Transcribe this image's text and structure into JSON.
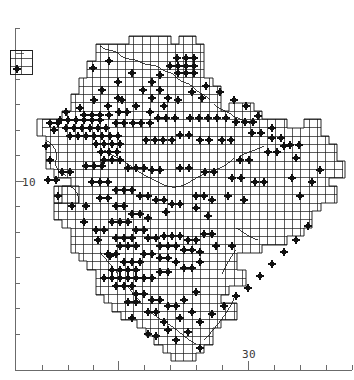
{
  "figure": {
    "kind": "distribution-dot-map",
    "background_color": "#ffffff",
    "line_color": "#111111",
    "dot_color": "#111111",
    "axis_color": "#6b6b6b"
  },
  "axes": {
    "x_axis": {
      "label_text": "30",
      "label_x": 249,
      "label_y": 358,
      "baseline_y": 370,
      "start_x": 15,
      "end_x": 352,
      "ticks": [
        15,
        42,
        68,
        93,
        118,
        144,
        170,
        196,
        222,
        248,
        274,
        300,
        326,
        352
      ],
      "major_ticks": [
        118,
        248
      ],
      "tick_len_minor": 5,
      "tick_len_major": 9
    },
    "y_axis": {
      "label_text": "10",
      "label_x": 22,
      "label_y": 186,
      "baseline_x": 15,
      "start_y": 28,
      "end_y": 370,
      "ticks": [
        28,
        53,
        79,
        104,
        130,
        155,
        181,
        206,
        232,
        257,
        283,
        308,
        334
      ],
      "major_ticks": [
        53,
        181
      ],
      "tick_len_minor": 5,
      "tick_len_major": 9
    }
  },
  "inset": {
    "name": "outlier-inset-box",
    "x": 10,
    "y": 50,
    "width": 22,
    "height": 24,
    "cols": 2,
    "rows": 3,
    "dots": [
      {
        "x": 17,
        "y": 69
      }
    ]
  },
  "grid": {
    "cell_size": 8.35,
    "origin_x": 42.0,
    "origin_y": 36.0,
    "cols": 36,
    "rows": 39,
    "note": "grid overlay clipped to region outline"
  },
  "chart_data": {
    "type": "scatter",
    "title": "",
    "xlabel": "",
    "ylabel": "",
    "grid": true,
    "legend": null,
    "x_tick_labels": [
      "30"
    ],
    "y_tick_labels": [
      "10"
    ],
    "marker": "filled-star",
    "marker_size_px": 6,
    "point_count": 243,
    "points": [
      [
        17,
        69
      ],
      [
        109,
        61
      ],
      [
        93,
        68
      ],
      [
        132,
        73
      ],
      [
        118,
        82
      ],
      [
        152,
        82
      ],
      [
        160,
        75
      ],
      [
        177,
        58
      ],
      [
        186,
        58
      ],
      [
        194,
        58
      ],
      [
        178,
        66
      ],
      [
        186,
        66
      ],
      [
        194,
        66
      ],
      [
        178,
        73
      ],
      [
        186,
        73
      ],
      [
        194,
        73
      ],
      [
        170,
        66
      ],
      [
        160,
        90
      ],
      [
        143,
        90
      ],
      [
        102,
        90
      ],
      [
        118,
        98
      ],
      [
        152,
        98
      ],
      [
        168,
        98
      ],
      [
        202,
        98
      ],
      [
        84,
        115
      ],
      [
        92,
        115
      ],
      [
        100,
        115
      ],
      [
        109,
        115
      ],
      [
        60,
        120
      ],
      [
        68,
        120
      ],
      [
        76,
        120
      ],
      [
        84,
        120
      ],
      [
        92,
        120
      ],
      [
        100,
        120
      ],
      [
        66,
        128
      ],
      [
        74,
        128
      ],
      [
        82,
        128
      ],
      [
        90,
        128
      ],
      [
        98,
        128
      ],
      [
        106,
        128
      ],
      [
        50,
        123
      ],
      [
        58,
        123
      ],
      [
        116,
        123
      ],
      [
        124,
        123
      ],
      [
        133,
        123
      ],
      [
        141,
        123
      ],
      [
        150,
        123
      ],
      [
        119,
        112
      ],
      [
        127,
        112
      ],
      [
        158,
        118
      ],
      [
        166,
        118
      ],
      [
        175,
        118
      ],
      [
        190,
        118
      ],
      [
        199,
        118
      ],
      [
        208,
        118
      ],
      [
        217,
        118
      ],
      [
        226,
        118
      ],
      [
        236,
        122
      ],
      [
        245,
        122
      ],
      [
        253,
        122
      ],
      [
        70,
        136
      ],
      [
        78,
        136
      ],
      [
        86,
        136
      ],
      [
        94,
        136
      ],
      [
        102,
        136
      ],
      [
        110,
        136
      ],
      [
        118,
        136
      ],
      [
        96,
        144
      ],
      [
        104,
        144
      ],
      [
        112,
        144
      ],
      [
        120,
        144
      ],
      [
        101,
        152
      ],
      [
        109,
        152
      ],
      [
        117,
        152
      ],
      [
        146,
        140
      ],
      [
        155,
        140
      ],
      [
        163,
        140
      ],
      [
        172,
        140
      ],
      [
        180,
        135
      ],
      [
        189,
        135
      ],
      [
        200,
        140
      ],
      [
        209,
        140
      ],
      [
        222,
        140
      ],
      [
        231,
        140
      ],
      [
        252,
        133
      ],
      [
        261,
        133
      ],
      [
        272,
        138
      ],
      [
        281,
        138
      ],
      [
        290,
        145
      ],
      [
        299,
        145
      ],
      [
        268,
        152
      ],
      [
        277,
        152
      ],
      [
        240,
        160
      ],
      [
        249,
        160
      ],
      [
        104,
        160
      ],
      [
        112,
        160
      ],
      [
        120,
        160
      ],
      [
        86,
        166
      ],
      [
        94,
        166
      ],
      [
        102,
        166
      ],
      [
        128,
        168
      ],
      [
        136,
        168
      ],
      [
        144,
        168
      ],
      [
        152,
        170
      ],
      [
        160,
        170
      ],
      [
        180,
        168
      ],
      [
        189,
        168
      ],
      [
        205,
        172
      ],
      [
        214,
        172
      ],
      [
        232,
        178
      ],
      [
        241,
        178
      ],
      [
        255,
        182
      ],
      [
        264,
        182
      ],
      [
        292,
        178
      ],
      [
        62,
        172
      ],
      [
        70,
        172
      ],
      [
        48,
        180
      ],
      [
        56,
        180
      ],
      [
        92,
        182
      ],
      [
        100,
        182
      ],
      [
        108,
        182
      ],
      [
        116,
        190
      ],
      [
        124,
        190
      ],
      [
        132,
        190
      ],
      [
        140,
        196
      ],
      [
        148,
        196
      ],
      [
        156,
        200
      ],
      [
        164,
        200
      ],
      [
        172,
        204
      ],
      [
        180,
        204
      ],
      [
        196,
        196
      ],
      [
        204,
        196
      ],
      [
        212,
        200
      ],
      [
        228,
        196
      ],
      [
        244,
        200
      ],
      [
        100,
        198
      ],
      [
        108,
        198
      ],
      [
        116,
        206
      ],
      [
        124,
        206
      ],
      [
        86,
        206
      ],
      [
        132,
        214
      ],
      [
        140,
        214
      ],
      [
        148,
        218
      ],
      [
        166,
        212
      ],
      [
        196,
        208
      ],
      [
        208,
        216
      ],
      [
        112,
        222
      ],
      [
        120,
        222
      ],
      [
        128,
        222
      ],
      [
        136,
        230
      ],
      [
        144,
        230
      ],
      [
        96,
        230
      ],
      [
        104,
        230
      ],
      [
        116,
        238
      ],
      [
        124,
        238
      ],
      [
        132,
        238
      ],
      [
        148,
        238
      ],
      [
        156,
        238
      ],
      [
        164,
        236
      ],
      [
        172,
        236
      ],
      [
        180,
        236
      ],
      [
        188,
        240
      ],
      [
        196,
        240
      ],
      [
        204,
        234
      ],
      [
        212,
        234
      ],
      [
        160,
        246
      ],
      [
        168,
        246
      ],
      [
        176,
        246
      ],
      [
        184,
        250
      ],
      [
        192,
        250
      ],
      [
        120,
        246
      ],
      [
        128,
        246
      ],
      [
        136,
        246
      ],
      [
        144,
        254
      ],
      [
        152,
        254
      ],
      [
        108,
        254
      ],
      [
        116,
        254
      ],
      [
        124,
        262
      ],
      [
        132,
        262
      ],
      [
        140,
        262
      ],
      [
        160,
        258
      ],
      [
        168,
        258
      ],
      [
        176,
        262
      ],
      [
        200,
        252
      ],
      [
        216,
        246
      ],
      [
        232,
        246
      ],
      [
        112,
        270
      ],
      [
        120,
        270
      ],
      [
        128,
        270
      ],
      [
        136,
        270
      ],
      [
        104,
        278
      ],
      [
        112,
        278
      ],
      [
        120,
        278
      ],
      [
        128,
        278
      ],
      [
        136,
        278
      ],
      [
        116,
        286
      ],
      [
        124,
        286
      ],
      [
        132,
        286
      ],
      [
        144,
        278
      ],
      [
        152,
        278
      ],
      [
        160,
        272
      ],
      [
        168,
        272
      ],
      [
        184,
        268
      ],
      [
        192,
        268
      ],
      [
        200,
        262
      ],
      [
        136,
        294
      ],
      [
        144,
        294
      ],
      [
        128,
        302
      ],
      [
        136,
        302
      ],
      [
        152,
        300
      ],
      [
        160,
        300
      ],
      [
        168,
        306
      ],
      [
        176,
        306
      ],
      [
        184,
        300
      ],
      [
        196,
        292
      ],
      [
        148,
        312
      ],
      [
        156,
        312
      ],
      [
        132,
        318
      ],
      [
        164,
        322
      ],
      [
        180,
        318
      ],
      [
        192,
        312
      ],
      [
        168,
        330
      ],
      [
        156,
        336
      ],
      [
        176,
        340
      ],
      [
        188,
        332
      ],
      [
        200,
        322
      ],
      [
        212,
        314
      ],
      [
        224,
        306
      ],
      [
        236,
        296
      ],
      [
        248,
        288
      ],
      [
        260,
        276
      ],
      [
        272,
        264
      ],
      [
        284,
        252
      ],
      [
        296,
        240
      ],
      [
        308,
        226
      ],
      [
        300,
        196
      ],
      [
        312,
        182
      ],
      [
        320,
        170
      ],
      [
        296,
        158
      ],
      [
        284,
        146
      ],
      [
        272,
        128
      ],
      [
        258,
        116
      ],
      [
        246,
        106
      ],
      [
        234,
        100
      ],
      [
        220,
        92
      ],
      [
        206,
        86
      ],
      [
        192,
        92
      ],
      [
        178,
        100
      ],
      [
        164,
        106
      ],
      [
        150,
        112
      ],
      [
        136,
        106
      ],
      [
        122,
        100
      ],
      [
        108,
        106
      ],
      [
        94,
        100
      ],
      [
        80,
        108
      ],
      [
        66,
        112
      ],
      [
        54,
        130
      ],
      [
        46,
        146
      ],
      [
        50,
        160
      ],
      [
        58,
        196
      ],
      [
        72,
        206
      ],
      [
        84,
        222
      ],
      [
        98,
        240
      ],
      [
        110,
        256
      ],
      [
        148,
        334
      ],
      [
        200,
        348
      ]
    ]
  },
  "region_outline": {
    "name": "county-boundary",
    "stroke": "#111111",
    "inner_boundary_present": true
  }
}
